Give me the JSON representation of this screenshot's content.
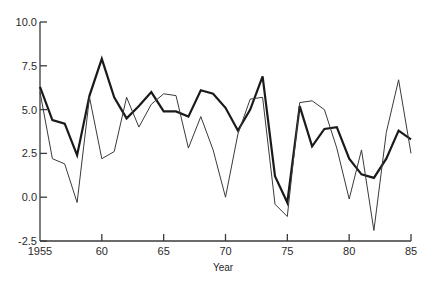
{
  "chart_data": {
    "type": "line",
    "title": "",
    "xlabel": "Year",
    "ylabel": "",
    "xlim": [
      1955,
      1985
    ],
    "ylim": [
      -2.5,
      10.0
    ],
    "grid": false,
    "legend": null,
    "y_ticks": [
      {
        "value": 10.0,
        "label": "10.0"
      },
      {
        "value": 7.5,
        "label": "7.5"
      },
      {
        "value": 5.0,
        "label": "5.0"
      },
      {
        "value": 2.5,
        "label": "2.5"
      },
      {
        "value": 0.0,
        "label": "0.0"
      },
      {
        "value": -2.5,
        "label": "-2.5"
      }
    ],
    "x_ticks": [
      {
        "value": 1955,
        "label": "1955"
      },
      {
        "value": 1960,
        "label": "60"
      },
      {
        "value": 1965,
        "label": "65"
      },
      {
        "value": 1970,
        "label": "70"
      },
      {
        "value": 1975,
        "label": "75"
      },
      {
        "value": 1980,
        "label": "80"
      },
      {
        "value": 1985,
        "label": "85"
      }
    ],
    "x": [
      1955,
      1956,
      1957,
      1958,
      1959,
      1960,
      1961,
      1962,
      1963,
      1964,
      1965,
      1966,
      1967,
      1968,
      1969,
      1970,
      1971,
      1972,
      1973,
      1974,
      1975,
      1976,
      1977,
      1978,
      1979,
      1980,
      1981,
      1982,
      1983,
      1984,
      1985
    ],
    "series": [
      {
        "name": "thick",
        "style": "thick",
        "values": [
          6.3,
          4.4,
          4.2,
          2.4,
          5.8,
          7.9,
          5.7,
          4.5,
          5.2,
          6.0,
          4.9,
          4.9,
          4.6,
          6.1,
          5.9,
          5.1,
          3.8,
          5.0,
          6.9,
          1.2,
          -0.3,
          5.2,
          2.9,
          3.9,
          4.0,
          2.2,
          1.3,
          1.1,
          2.2,
          3.8,
          3.3
        ]
      },
      {
        "name": "thin",
        "style": "thin",
        "values": [
          6.0,
          2.2,
          1.9,
          -0.3,
          5.7,
          2.2,
          2.6,
          5.7,
          4.0,
          5.3,
          5.9,
          5.8,
          2.8,
          4.6,
          2.7,
          0.0,
          3.6,
          5.6,
          5.7,
          -0.4,
          -1.1,
          5.4,
          5.5,
          5.0,
          2.8,
          -0.1,
          2.7,
          -1.9,
          3.7,
          6.7,
          2.5
        ]
      }
    ]
  },
  "colors": {
    "axis": "#3a3a3a",
    "thick_line": "#1a1a1a",
    "thin_line": "#3a3a3a",
    "text": "#2a2a2a"
  }
}
